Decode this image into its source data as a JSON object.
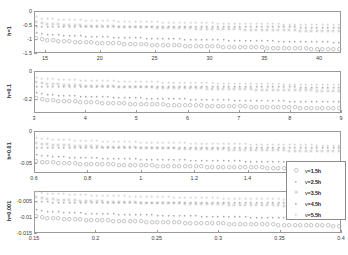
{
  "figure": {
    "type": "multi-panel-scatter",
    "panel_count": 4,
    "background": "#ffffff",
    "axis_color": "#9a9a9a"
  },
  "legend": {
    "position": "right-middle",
    "entries": [
      {
        "label": "v=1.5h",
        "marker": "circle",
        "color": "#9e9e9e"
      },
      {
        "label": "v=2.5h",
        "marker": "dot",
        "color": "#a8a8a8"
      },
      {
        "label": "v=3.5h",
        "marker": "star",
        "color": "#c0c0c0"
      },
      {
        "label": "v=4.5h",
        "marker": "square-dot",
        "color": "#b0b0b0"
      },
      {
        "label": "v=5.5h",
        "marker": "plus",
        "color": "#c8c8c8"
      }
    ]
  },
  "chart_data": [
    {
      "type": "scatter",
      "title": "",
      "ylabel": "h=1",
      "xlabel": "",
      "xlim": [
        14.0,
        42.0
      ],
      "ylim": [
        -1.5,
        0.0
      ],
      "xticks": [
        15,
        20,
        25,
        30,
        35,
        40
      ],
      "yticks": [
        0,
        -0.5,
        -1,
        -1.5
      ],
      "xticklabels": [
        "15",
        "20",
        "25",
        "30",
        "35",
        "40"
      ],
      "yticklabels": [
        "0",
        "-0.5",
        "-1",
        "-1.5"
      ],
      "grid": false,
      "n_points": 56,
      "series": [
        {
          "name": "v=1.5h",
          "marker": "circle",
          "color": "#9e9e9e",
          "y_start": -0.97,
          "y_end": -1.37,
          "curvature": 0.55
        },
        {
          "name": "v=2.5h",
          "marker": "dot",
          "color": "#a8a8a8",
          "y_start": -0.78,
          "y_end": -1.12,
          "curvature": 0.55
        },
        {
          "name": "v=3.5h",
          "marker": "star",
          "color": "#c0c0c0",
          "y_start": -0.4,
          "y_end": -0.72,
          "curvature": 0.55
        },
        {
          "name": "v=4.5h",
          "marker": "square-dot",
          "color": "#b0b0b0",
          "y_start": -0.55,
          "y_end": -0.58,
          "curvature": 0.35
        },
        {
          "name": "v=5.5h",
          "marker": "plus",
          "color": "#c8c8c8",
          "y_start": -0.22,
          "y_end": -0.5,
          "curvature": 0.5
        }
      ]
    },
    {
      "type": "scatter",
      "title": "",
      "ylabel": "h=0.1",
      "xlabel": "",
      "xlim": [
        3.0,
        9.0
      ],
      "ylim": [
        -0.3,
        0.0
      ],
      "xticks": [
        3,
        4,
        5,
        6,
        7,
        8,
        9
      ],
      "yticks": [
        0,
        -0.2
      ],
      "xticklabels": [
        "3",
        "4",
        "5",
        "6",
        "7",
        "8",
        "9"
      ],
      "yticklabels": [
        "0",
        "-0.2"
      ],
      "grid": false,
      "n_points": 56,
      "series": [
        {
          "name": "v=1.5h",
          "marker": "circle",
          "color": "#9e9e9e",
          "y_start": -0.196,
          "y_end": -0.268,
          "curvature": 0.55
        },
        {
          "name": "v=2.5h",
          "marker": "dot",
          "color": "#a8a8a8",
          "y_start": -0.158,
          "y_end": -0.222,
          "curvature": 0.55
        },
        {
          "name": "v=3.5h",
          "marker": "star",
          "color": "#c0c0c0",
          "y_start": -0.082,
          "y_end": -0.142,
          "curvature": 0.55
        },
        {
          "name": "v=4.5h",
          "marker": "square-dot",
          "color": "#b0b0b0",
          "y_start": -0.11,
          "y_end": -0.116,
          "curvature": 0.35
        },
        {
          "name": "v=5.5h",
          "marker": "plus",
          "color": "#c8c8c8",
          "y_start": -0.045,
          "y_end": -0.1,
          "curvature": 0.5
        }
      ]
    },
    {
      "type": "scatter",
      "title": "",
      "ylabel": "h=0.01",
      "xlabel": "",
      "xlim": [
        0.6,
        1.75
      ],
      "ylim": [
        -0.065,
        0.0
      ],
      "xticks": [
        0.6,
        0.8,
        1.0,
        1.2,
        1.4,
        1.6
      ],
      "yticks": [
        0,
        -0.05
      ],
      "xticklabels": [
        "0.6",
        "0.8",
        "1",
        "1.2",
        "1.4",
        "1.6"
      ],
      "yticklabels": [
        "0",
        "-0.05"
      ],
      "grid": false,
      "n_points": 56,
      "series": [
        {
          "name": "v=1.5h",
          "marker": "circle",
          "color": "#9e9e9e",
          "y_start": -0.0465,
          "y_end": -0.0585,
          "curvature": 0.55
        },
        {
          "name": "v=2.5h",
          "marker": "dot",
          "color": "#a8a8a8",
          "y_start": -0.037,
          "y_end": -0.049,
          "curvature": 0.55
        },
        {
          "name": "v=3.5h",
          "marker": "star",
          "color": "#c0c0c0",
          "y_start": -0.0185,
          "y_end": -0.0315,
          "curvature": 0.55
        },
        {
          "name": "v=4.5h",
          "marker": "square-dot",
          "color": "#b0b0b0",
          "y_start": -0.0255,
          "y_end": -0.026,
          "curvature": 0.35
        },
        {
          "name": "v=5.5h",
          "marker": "plus",
          "color": "#c8c8c8",
          "y_start": -0.01,
          "y_end": -0.0225,
          "curvature": 0.5
        }
      ]
    },
    {
      "type": "scatter",
      "title": "",
      "ylabel": "h=0.001",
      "xlabel": "",
      "xlim": [
        0.15,
        0.4
      ],
      "ylim": [
        -0.015,
        -0.002
      ],
      "xticks": [
        0.15,
        0.2,
        0.25,
        0.3,
        0.35,
        0.4
      ],
      "yticks": [
        -0.005,
        -0.01,
        -0.015
      ],
      "xticklabels": [
        "0.15",
        "0.2",
        "0.25",
        "0.3",
        "0.35",
        "0.4"
      ],
      "yticklabels": [
        "-0.005",
        "-0.01",
        "-0.015"
      ],
      "grid": false,
      "n_points": 56,
      "series": [
        {
          "name": "v=1.5h",
          "marker": "circle",
          "color": "#9e9e9e",
          "y_start": -0.0098,
          "y_end": -0.0128,
          "curvature": 0.55
        },
        {
          "name": "v=2.5h",
          "marker": "dot",
          "color": "#a8a8a8",
          "y_start": -0.0079,
          "y_end": -0.0106,
          "curvature": 0.55
        },
        {
          "name": "v=3.5h",
          "marker": "star",
          "color": "#c0c0c0",
          "y_start": -0.004,
          "y_end": -0.0068,
          "curvature": 0.55
        },
        {
          "name": "v=4.5h",
          "marker": "square-dot",
          "color": "#b0b0b0",
          "y_start": -0.0054,
          "y_end": -0.0056,
          "curvature": 0.35
        },
        {
          "name": "v=5.5h",
          "marker": "plus",
          "color": "#c8c8c8",
          "y_start": -0.0022,
          "y_end": -0.0048,
          "curvature": 0.5
        }
      ]
    }
  ]
}
